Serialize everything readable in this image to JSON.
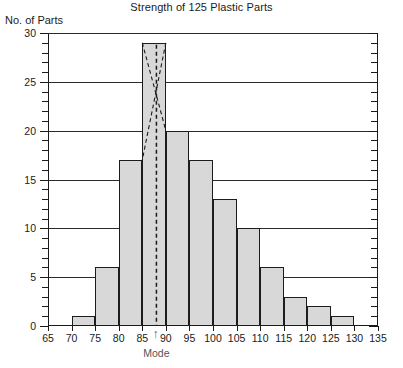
{
  "chart_data": {
    "type": "bar",
    "title": "Strength of 125 Plastic Parts",
    "subtitle": "",
    "xlabel": "",
    "ylabel": "No. of Parts",
    "xlim": [
      65,
      135
    ],
    "ylim": [
      0,
      30
    ],
    "grid": true,
    "legend": null,
    "bin_width": 5,
    "bin_edges": [
      65,
      70,
      75,
      80,
      85,
      90,
      95,
      100,
      105,
      110,
      115,
      120,
      125,
      130,
      135
    ],
    "categories": [
      "65-70",
      "70-75",
      "75-80",
      "80-85",
      "85-90",
      "90-95",
      "95-100",
      "100-105",
      "105-110",
      "110-115",
      "115-120",
      "120-125",
      "125-130",
      "130-135"
    ],
    "values": [
      0,
      1,
      6,
      17,
      29,
      20,
      17,
      13,
      10,
      6,
      3,
      2,
      1,
      0
    ],
    "total_count": 125,
    "x_ticks": [
      65,
      70,
      75,
      80,
      85,
      90,
      95,
      100,
      105,
      110,
      115,
      120,
      125,
      130,
      135
    ],
    "y_ticks_major": [
      0,
      5,
      10,
      15,
      20,
      25,
      30
    ],
    "y_minor_tick_step": 1,
    "annotations": [
      {
        "name": "mode",
        "label": "Mode",
        "x_value": 88,
        "marker": "dashed-vertical-line-with-arrow",
        "construction": "cross-lines from modal bar top corners to adjacent bar tops"
      }
    ],
    "colors": {
      "bar_fill": "#d8d8d8",
      "bar_edge": "#1c1c1c",
      "grid": "#2b2b2b",
      "axis": "#1a1a1a",
      "annotation": "#555555"
    }
  },
  "caption": {
    "text": ""
  }
}
